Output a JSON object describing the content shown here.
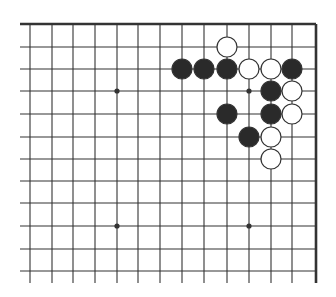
{
  "diagram": {
    "type": "go-board-corner",
    "colors": {
      "background": "#ffffff",
      "line": "#333333",
      "black_stone": "#2a2a2a",
      "white_stone": "#ffffff",
      "stone_outline": "#333333"
    },
    "columns_x": [
      30,
      52,
      73,
      95,
      117,
      138,
      160,
      182,
      204,
      227,
      249,
      271,
      292,
      316
    ],
    "rows_y": [
      24,
      47,
      69,
      91,
      114,
      137,
      159,
      181,
      203,
      226,
      249,
      271
    ],
    "top_edge_y": 24,
    "right_edge_x": 316,
    "line_extend_left": 20,
    "line_extend_bottom": 283,
    "star_points": [
      {
        "col": 4,
        "row": 3
      },
      {
        "col": 10,
        "row": 3
      },
      {
        "col": 4,
        "row": 9
      },
      {
        "col": 10,
        "row": 9
      }
    ],
    "stones": [
      {
        "color": "white",
        "col": 9,
        "row": 1
      },
      {
        "color": "black",
        "col": 7,
        "row": 2
      },
      {
        "color": "black",
        "col": 8,
        "row": 2
      },
      {
        "color": "black",
        "col": 9,
        "row": 2
      },
      {
        "color": "white",
        "col": 10,
        "row": 2
      },
      {
        "color": "white",
        "col": 11,
        "row": 2
      },
      {
        "color": "black",
        "col": 12,
        "row": 2
      },
      {
        "color": "black",
        "col": 11,
        "row": 3
      },
      {
        "color": "white",
        "col": 12,
        "row": 3
      },
      {
        "color": "black",
        "col": 9,
        "row": 4
      },
      {
        "color": "black",
        "col": 11,
        "row": 4
      },
      {
        "color": "white",
        "col": 12,
        "row": 4
      },
      {
        "color": "black",
        "col": 10,
        "row": 5
      },
      {
        "color": "white",
        "col": 11,
        "row": 5
      },
      {
        "color": "white",
        "col": 11,
        "row": 6
      }
    ]
  }
}
